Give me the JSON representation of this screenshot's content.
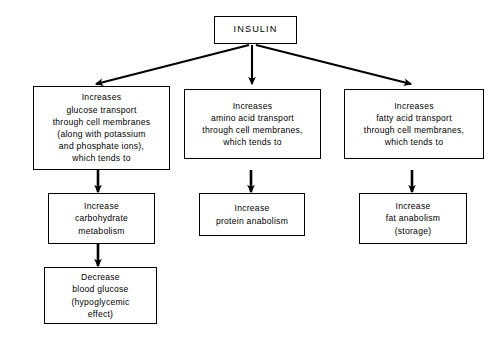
{
  "diagram": {
    "title_box": {
      "label": "INSULIN"
    },
    "branches": [
      {
        "name": "glucose",
        "primary": "Increases\nglucose transport\nthrough cell membranes\n(along with potassium\nand phosphate ions),\nwhich tends to",
        "secondary": "Increase\ncarbohydrate\nmetabolism",
        "tertiary": "Decrease\nblood glucose\n(hypoglycemic\neffect)"
      },
      {
        "name": "amino-acid",
        "primary": "Increases\namino acid transport\nthrough cell membranes,\nwhich tends to",
        "secondary": "Increase\nprotein anabolism"
      },
      {
        "name": "fatty-acid",
        "primary": "Increases\nfatty acid transport\nthrough cell membranes,\nwhich tends to",
        "secondary": "Increase\nfat anabolism\n(storage)"
      }
    ],
    "colors": {
      "stroke": "#000000",
      "background": "#ffffff",
      "text": "#000000"
    }
  }
}
